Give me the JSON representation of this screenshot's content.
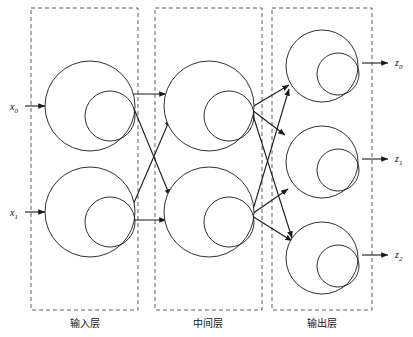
{
  "figure": {
    "width": 413,
    "height": 337,
    "background_color": "#ffffff",
    "stroke_color": "#1a1a1a",
    "box_stroke_color": "#4d4d4d"
  },
  "layers": [
    {
      "id": "input",
      "caption": "输入层",
      "caption_x": 85,
      "caption_y": 327,
      "box": {
        "x": 31,
        "y": 8,
        "w": 107,
        "h": 302
      },
      "nodes": [
        {
          "id": "x0",
          "cx": 90,
          "cy": 106,
          "r": 45,
          "inner_cx": 110,
          "inner_cy": 116,
          "inner_r": 25
        },
        {
          "id": "x1",
          "cx": 90,
          "cy": 212,
          "r": 45,
          "inner_cx": 110,
          "inner_cy": 222,
          "inner_r": 25
        }
      ]
    },
    {
      "id": "hidden",
      "caption": "中间层",
      "caption_x": 208,
      "caption_y": 327,
      "box": {
        "x": 155,
        "y": 8,
        "w": 107,
        "h": 302
      },
      "nodes": [
        {
          "id": "h0",
          "cx": 209,
          "cy": 106,
          "r": 45,
          "inner_cx": 229,
          "inner_cy": 116,
          "inner_r": 25
        },
        {
          "id": "h1",
          "cx": 209,
          "cy": 212,
          "r": 45,
          "inner_cx": 229,
          "inner_cy": 222,
          "inner_r": 25
        }
      ]
    },
    {
      "id": "output",
      "caption": "输出层",
      "caption_x": 322,
      "caption_y": 327,
      "box": {
        "x": 272,
        "y": 8,
        "w": 100,
        "h": 302
      },
      "nodes": [
        {
          "id": "z0",
          "cx": 322,
          "cy": 66,
          "r": 36,
          "inner_cx": 338,
          "inner_cy": 74,
          "inner_r": 21
        },
        {
          "id": "z1",
          "cx": 322,
          "cy": 162,
          "r": 36,
          "inner_cx": 338,
          "inner_cy": 170,
          "inner_r": 21
        },
        {
          "id": "z2",
          "cx": 322,
          "cy": 258,
          "r": 36,
          "inner_cx": 338,
          "inner_cy": 266,
          "inner_r": 21
        }
      ]
    }
  ],
  "inputs": [
    {
      "id": "x0",
      "base": "x",
      "sub": "0",
      "label_x": 10,
      "label_y": 110,
      "line_x1": 25,
      "line_y1": 106,
      "line_x2": 45,
      "line_y2": 106
    },
    {
      "id": "x1",
      "base": "x",
      "sub": "1",
      "label_x": 10,
      "label_y": 216,
      "line_x1": 25,
      "line_y1": 212,
      "line_x2": 45,
      "line_y2": 212
    }
  ],
  "outputs": [
    {
      "id": "z0",
      "base": "z",
      "sub": "0",
      "label_x": 395,
      "label_y": 66,
      "line_x1": 362,
      "line_y1": 63,
      "line_x2": 388,
      "line_y2": 63
    },
    {
      "id": "z1",
      "base": "z",
      "sub": "1",
      "label_x": 395,
      "label_y": 162,
      "line_x1": 362,
      "line_y1": 159,
      "line_x2": 388,
      "line_y2": 159
    },
    {
      "id": "z2",
      "base": "z",
      "sub": "2",
      "label_x": 395,
      "label_y": 258,
      "line_x1": 362,
      "line_y1": 255,
      "line_x2": 388,
      "line_y2": 255
    }
  ],
  "edges": [
    {
      "id": "x0-h0",
      "from": "x0",
      "to": "h0",
      "x1": 130,
      "y1": 94,
      "x2": 166,
      "y2": 94
    },
    {
      "id": "x0-h1",
      "from": "x0",
      "to": "h1",
      "x1": 130,
      "y1": 99,
      "x2": 170,
      "y2": 196
    },
    {
      "id": "x1-h0",
      "from": "x1",
      "to": "h0",
      "x1": 130,
      "y1": 212,
      "x2": 170,
      "y2": 119
    },
    {
      "id": "x1-h1",
      "from": "x1",
      "to": "h1",
      "x1": 130,
      "y1": 220,
      "x2": 166,
      "y2": 220
    },
    {
      "id": "h0-z0",
      "from": "h0",
      "to": "z0",
      "x1": 252,
      "y1": 107,
      "x2": 289,
      "y2": 85
    },
    {
      "id": "h0-z1",
      "from": "h0",
      "to": "z1",
      "x1": 252,
      "y1": 110,
      "x2": 285,
      "y2": 135
    },
    {
      "id": "h0-z2",
      "from": "h0",
      "to": "z2",
      "x1": 252,
      "y1": 112,
      "x2": 292,
      "y2": 238
    },
    {
      "id": "h1-z0",
      "from": "h1",
      "to": "z0",
      "x1": 252,
      "y1": 213,
      "x2": 289,
      "y2": 89
    },
    {
      "id": "h1-z1",
      "from": "h1",
      "to": "z1",
      "x1": 252,
      "y1": 214,
      "x2": 288,
      "y2": 189
    },
    {
      "id": "h1-z2",
      "from": "h1",
      "to": "z2",
      "x1": 252,
      "y1": 216,
      "x2": 292,
      "y2": 241
    }
  ]
}
